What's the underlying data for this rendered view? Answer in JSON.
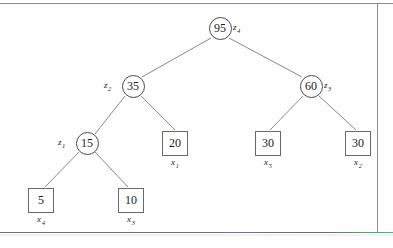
{
  "tree": {
    "internal_nodes": [
      {
        "id": "root",
        "value": "95",
        "label_text": "z",
        "label_sub": "4",
        "label_side": "right",
        "cx": 220,
        "cy": 28
      },
      {
        "id": "left",
        "value": "35",
        "label_text": "z",
        "label_sub": "2",
        "label_side": "left",
        "cx": 133,
        "cy": 86
      },
      {
        "id": "right",
        "value": "60",
        "label_text": "z",
        "label_sub": "3",
        "label_side": "right",
        "cx": 311,
        "cy": 86
      },
      {
        "id": "ll",
        "value": "15",
        "label_text": "z",
        "label_sub": "1",
        "label_side": "left",
        "cx": 87,
        "cy": 143
      }
    ],
    "leaf_nodes": [
      {
        "id": "leaf20",
        "value": "20",
        "label_text": "x",
        "label_sub": "1",
        "cx": 175,
        "cy": 143
      },
      {
        "id": "leaf30a",
        "value": "30",
        "label_text": "x",
        "label_sub": "5",
        "cx": 268,
        "cy": 143
      },
      {
        "id": "leaf30b",
        "value": "30",
        "label_text": "x",
        "label_sub": "2",
        "cx": 358,
        "cy": 143
      },
      {
        "id": "leaf5",
        "value": "5",
        "label_text": "x",
        "label_sub": "4",
        "cx": 41,
        "cy": 200
      },
      {
        "id": "leaf10",
        "value": "10",
        "label_text": "x",
        "label_sub": "3",
        "cx": 131,
        "cy": 200
      }
    ],
    "edges": [
      {
        "from": "root",
        "to": "left",
        "x1": 211,
        "y1": 38,
        "x2": 142,
        "y2": 77
      },
      {
        "from": "root",
        "to": "right",
        "x1": 229,
        "y1": 38,
        "x2": 302,
        "y2": 77
      },
      {
        "from": "left",
        "to": "ll",
        "x1": 125,
        "y1": 96,
        "x2": 95,
        "y2": 134
      },
      {
        "from": "left",
        "to": "leaf20",
        "x1": 141,
        "y1": 96,
        "x2": 175,
        "y2": 130
      },
      {
        "from": "right",
        "to": "leaf30a",
        "x1": 303,
        "y1": 96,
        "x2": 270,
        "y2": 130
      },
      {
        "from": "right",
        "to": "leaf30b",
        "x1": 319,
        "y1": 96,
        "x2": 356,
        "y2": 130
      },
      {
        "from": "ll",
        "to": "leaf5",
        "x1": 79,
        "y1": 152,
        "x2": 45,
        "y2": 187
      },
      {
        "from": "ll",
        "to": "leaf10",
        "x1": 95,
        "y1": 152,
        "x2": 128,
        "y2": 187
      }
    ]
  },
  "colors": {
    "ink": "#1b1b1b",
    "node_stroke": "#4a4a4a",
    "box_stroke": "#6a6a6a",
    "edge_stroke": "#7a7a7a",
    "frame": "#8d8d90",
    "background": "#fefefe"
  }
}
